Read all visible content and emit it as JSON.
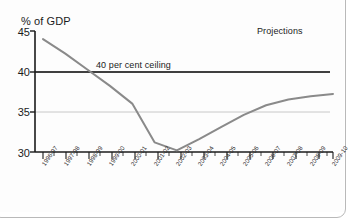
{
  "chart_data": {
    "type": "line",
    "title": "",
    "ylabel": "% of GDP",
    "xlabel": "",
    "ylim": [
      30,
      45
    ],
    "yticks": [
      30,
      35,
      40,
      45
    ],
    "grid": true,
    "legend": false,
    "categories": [
      "1996-97",
      "1997-98",
      "1998-99",
      "1999-00",
      "2000-01",
      "2001-02",
      "2002-03",
      "2003-04",
      "2004-05",
      "2005-06",
      "2006-07",
      "2007-08",
      "2008-09",
      "2009-10"
    ],
    "series": [
      {
        "name": "Net debt",
        "values": [
          44.0,
          42.2,
          40.2,
          38.2,
          36.0,
          31.2,
          30.2,
          31.6,
          33.1,
          34.6,
          35.8,
          36.5,
          36.9,
          37.2
        ]
      }
    ],
    "reference_lines": [
      {
        "label": "40 per cent ceiling",
        "value": 40,
        "color": "#000000"
      },
      {
        "label": "",
        "value": 35,
        "color": "#c8c8c8"
      }
    ],
    "annotations": [
      {
        "text": "Projections",
        "x": "2007-08",
        "y": 44
      },
      {
        "text": "40 per cent ceiling",
        "x": "1998-99",
        "y": 41
      }
    ]
  },
  "axis": {
    "y_title": "% of GDP",
    "y_labels": [
      "45",
      "40",
      "35",
      "30"
    ]
  },
  "annotations": {
    "ceiling": "40 per cent ceiling",
    "projections": "Projections"
  },
  "x_labels": [
    "1996-97",
    "1997-98",
    "1998-99",
    "1999-00",
    "2000-01",
    "2001-02",
    "2002-03",
    "2003-04",
    "2004-05",
    "2005-06",
    "2006-07",
    "2007-08",
    "2008-09",
    "2009-10"
  ],
  "colors": {
    "line": "#8a8a8a",
    "ceiling_line": "#000000",
    "grid": "#c8c8c8",
    "axis": "#1b1b1b",
    "background": "#fdfdfd"
  }
}
